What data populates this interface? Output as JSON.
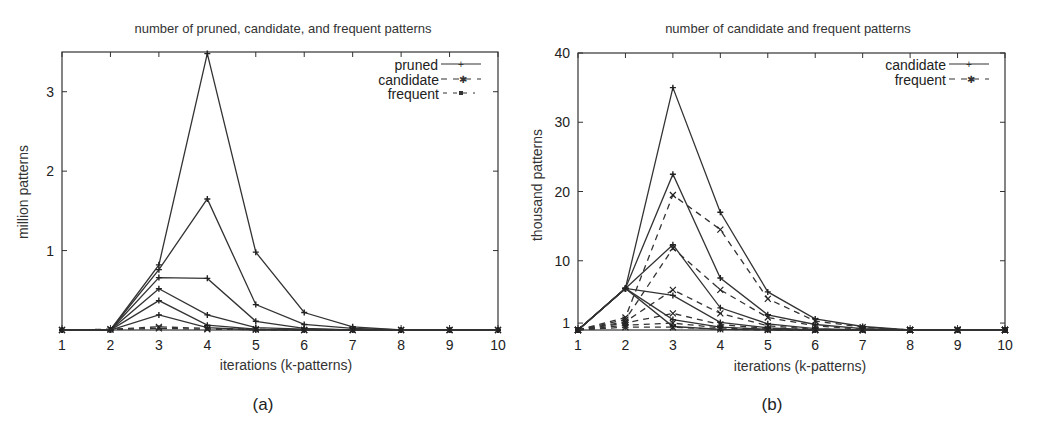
{
  "figure": {
    "panels": [
      {
        "caption": "(a)"
      },
      {
        "caption": "(b)"
      }
    ]
  },
  "chart_data": [
    {
      "type": "line",
      "title": "number of pruned, candidate, and frequent patterns",
      "xlabel": "iterations (k-patterns)",
      "ylabel": "million patterns",
      "caption": "(a)",
      "x": [
        1,
        2,
        3,
        4,
        5,
        6,
        7,
        8,
        9,
        10
      ],
      "xticks": [
        "1",
        "2",
        "3",
        "4",
        "5",
        "6",
        "7",
        "8",
        "9",
        "10"
      ],
      "yticks": [
        "1",
        "2",
        "3"
      ],
      "ytick_values": [
        1,
        2,
        3
      ],
      "xlim": [
        1,
        10
      ],
      "ylim": [
        0,
        3.5
      ],
      "grid": false,
      "legend_position": "top-right",
      "legend": [
        {
          "label": "pruned",
          "style": "solid",
          "marker": "+"
        },
        {
          "label": "candidate",
          "style": "dashed",
          "marker": "*"
        },
        {
          "label": "frequent",
          "style": "dashed",
          "marker": "square"
        }
      ],
      "series": [
        {
          "name": "pruned (run 1)",
          "style": "solid",
          "values": [
            0,
            0,
            0.82,
            3.48,
            0.98,
            0.22,
            0.04,
            0,
            0,
            0
          ]
        },
        {
          "name": "pruned (run 2)",
          "style": "solid",
          "values": [
            0,
            0,
            0.76,
            1.65,
            0.32,
            0.07,
            0.02,
            0,
            0,
            0
          ]
        },
        {
          "name": "pruned (run 3)",
          "style": "solid",
          "values": [
            0,
            0,
            0.66,
            0.65,
            0.11,
            0.02,
            0,
            0,
            0,
            0
          ]
        },
        {
          "name": "pruned (run 4)",
          "style": "solid",
          "values": [
            0,
            0,
            0.52,
            0.19,
            0.03,
            0.01,
            0,
            0,
            0,
            0
          ]
        },
        {
          "name": "pruned (run 5)",
          "style": "solid",
          "values": [
            0,
            0,
            0.37,
            0.06,
            0.01,
            0,
            0,
            0,
            0,
            0
          ]
        },
        {
          "name": "pruned (run 6)",
          "style": "solid",
          "values": [
            0,
            0,
            0.19,
            0.03,
            0,
            0,
            0,
            0,
            0,
            0
          ]
        },
        {
          "name": "candidate (all runs)",
          "style": "dashed",
          "values": [
            0,
            0.01,
            0.04,
            0.02,
            0.01,
            0,
            0,
            0,
            0,
            0
          ]
        },
        {
          "name": "frequent (all runs)",
          "style": "dashed",
          "values": [
            0,
            0.005,
            0.02,
            0.01,
            0.005,
            0,
            0,
            0,
            0,
            0
          ]
        }
      ]
    },
    {
      "type": "line",
      "title": "number of candidate and frequent patterns",
      "xlabel": "iterations (k-patterns)",
      "ylabel": "thousand patterns",
      "caption": "(b)",
      "x": [
        1,
        2,
        3,
        4,
        5,
        6,
        7,
        8,
        9,
        10
      ],
      "xticks": [
        "1",
        "2",
        "3",
        "4",
        "5",
        "6",
        "7",
        "8",
        "9",
        "10"
      ],
      "yticks": [
        "1",
        "10",
        "20",
        "30",
        "40"
      ],
      "ytick_values": [
        1,
        10,
        20,
        30,
        40
      ],
      "xlim": [
        1,
        10
      ],
      "ylim": [
        0,
        40
      ],
      "grid": false,
      "legend_position": "top-right",
      "legend": [
        {
          "label": "candidate",
          "style": "solid",
          "marker": "+"
        },
        {
          "label": "frequent",
          "style": "dashed",
          "marker": "*"
        }
      ],
      "series": [
        {
          "name": "candidate (run 1)",
          "style": "solid",
          "values": [
            0,
            6,
            35,
            17,
            5.5,
            1.6,
            0.5,
            0,
            0,
            0
          ]
        },
        {
          "name": "candidate (run 2)",
          "style": "solid",
          "values": [
            0,
            6,
            22.5,
            7.5,
            2.2,
            0.8,
            0.2,
            0,
            0,
            0
          ]
        },
        {
          "name": "candidate (run 3)",
          "style": "solid",
          "values": [
            0,
            6,
            12.3,
            3.2,
            0.9,
            0.2,
            0,
            0,
            0,
            0
          ]
        },
        {
          "name": "candidate (run 4)",
          "style": "solid",
          "values": [
            0,
            6,
            5,
            1.1,
            0.3,
            0,
            0,
            0,
            0,
            0
          ]
        },
        {
          "name": "candidate (run 5)",
          "style": "solid",
          "values": [
            0,
            6,
            1.5,
            0.4,
            0.1,
            0,
            0,
            0,
            0,
            0
          ]
        },
        {
          "name": "candidate (run 6)",
          "style": "solid",
          "values": [
            0,
            6,
            0.5,
            0.1,
            0,
            0,
            0,
            0,
            0,
            0
          ]
        },
        {
          "name": "frequent (run 1)",
          "style": "dashed",
          "values": [
            0,
            1.8,
            19.5,
            14.5,
            4.5,
            1.3,
            0.4,
            0,
            0,
            0
          ]
        },
        {
          "name": "frequent (run 2)",
          "style": "dashed",
          "values": [
            0,
            1.5,
            11.8,
            5.8,
            1.8,
            0.6,
            0.1,
            0,
            0,
            0
          ]
        },
        {
          "name": "frequent (run 3)",
          "style": "dashed",
          "values": [
            0,
            1.2,
            5.8,
            2.4,
            0.6,
            0.1,
            0,
            0,
            0,
            0
          ]
        },
        {
          "name": "frequent (run 4)",
          "style": "dashed",
          "values": [
            0,
            1.0,
            2.4,
            0.8,
            0.2,
            0,
            0,
            0,
            0,
            0
          ]
        },
        {
          "name": "frequent (run 5)",
          "style": "dashed",
          "values": [
            0,
            0.7,
            1.0,
            0.3,
            0.05,
            0,
            0,
            0,
            0,
            0
          ]
        },
        {
          "name": "frequent (run 6)",
          "style": "dashed",
          "values": [
            0,
            0.4,
            0.4,
            0.1,
            0,
            0,
            0,
            0,
            0,
            0
          ]
        }
      ]
    }
  ]
}
